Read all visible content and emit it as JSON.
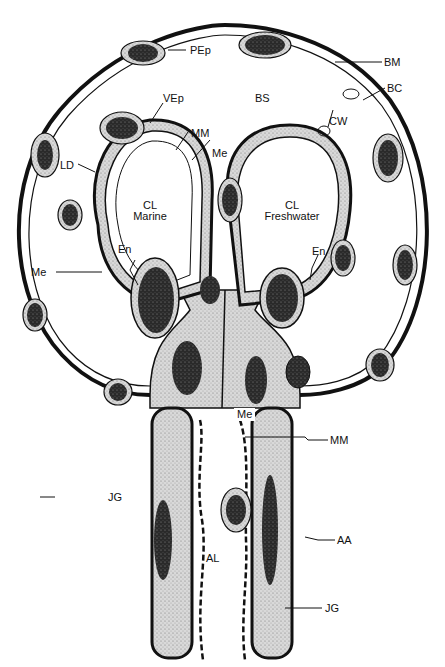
{
  "figure": {
    "type": "biological cross-section diagram",
    "colors": {
      "ink": "#111111",
      "cytoplasm": "#cfcfcf",
      "nucleus": "#2a2a2a",
      "background": "#ffffff"
    }
  },
  "labels": {
    "PEp": "PEp",
    "BM": "BM",
    "BS": "BS",
    "BC": "BC",
    "VEp": "VEp",
    "MM_top": "MM",
    "Me_top": "Me",
    "CW": "CW",
    "LD": "LD",
    "CL_left": "CL",
    "marine": "Marine",
    "CL_right": "CL",
    "freshwater": "Freshwater",
    "En_left": "En",
    "En_right": "En",
    "Me_left": "Me",
    "Me_center": "Me",
    "MM_bottom": "MM",
    "JG_left": "JG",
    "AL": "AL",
    "AA": "AA",
    "JG_right": "JG"
  },
  "compartments": [
    {
      "id": "CL",
      "name": "Marine",
      "side": "left"
    },
    {
      "id": "CL",
      "name": "Freshwater",
      "side": "right"
    }
  ]
}
